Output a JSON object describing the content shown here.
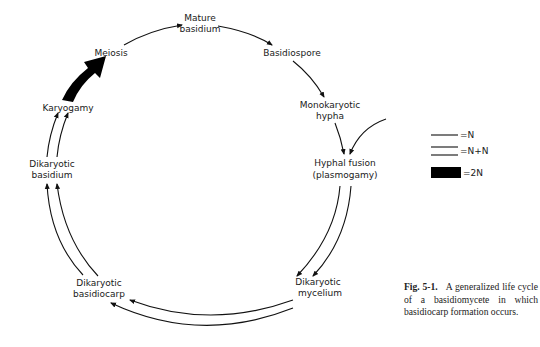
{
  "figure": {
    "type": "life-cycle diagram",
    "nodes": [
      {
        "id": "mature_basidium",
        "lines": [
          "Mature",
          "basidium"
        ]
      },
      {
        "id": "basidiospore",
        "lines": [
          "Basidiospore"
        ]
      },
      {
        "id": "monokaryotic_hypha",
        "lines": [
          "Monokaryotic",
          "hypha"
        ]
      },
      {
        "id": "hyphal_fusion",
        "lines": [
          "Hyphal fusion",
          "(plasmogamy)"
        ]
      },
      {
        "id": "dikaryotic_mycelium",
        "lines": [
          "Dikaryotic",
          "mycelium"
        ]
      },
      {
        "id": "dikaryotic_basidiocarp",
        "lines": [
          "Dikaryotic",
          "basidiocarp"
        ]
      },
      {
        "id": "dikaryotic_basidium",
        "lines": [
          "Dikaryotic",
          "basidium"
        ]
      },
      {
        "id": "karyogamy",
        "lines": [
          "Karyogamy"
        ]
      },
      {
        "id": "meiosis",
        "lines": [
          "Meiosis"
        ]
      }
    ],
    "edges": [
      {
        "from": "meiosis",
        "to": "mature_basidium",
        "ploidy": "N"
      },
      {
        "from": "mature_basidium",
        "to": "basidiospore",
        "ploidy": "N"
      },
      {
        "from": "basidiospore",
        "to": "monokaryotic_hypha",
        "ploidy": "N"
      },
      {
        "from": "monokaryotic_hypha",
        "to": "hyphal_fusion",
        "ploidy": "N"
      },
      {
        "from": "external",
        "to": "hyphal_fusion",
        "ploidy": "N"
      },
      {
        "from": "hyphal_fusion",
        "to": "dikaryotic_mycelium",
        "ploidy": "N+N"
      },
      {
        "from": "dikaryotic_mycelium",
        "to": "dikaryotic_basidiocarp",
        "ploidy": "N+N"
      },
      {
        "from": "dikaryotic_basidiocarp",
        "to": "dikaryotic_basidium",
        "ploidy": "N+N"
      },
      {
        "from": "dikaryotic_basidium",
        "to": "karyogamy",
        "ploidy": "N+N"
      },
      {
        "from": "karyogamy",
        "to": "meiosis",
        "ploidy": "2N"
      }
    ]
  },
  "labels": {
    "mature_1": "Mature",
    "mature_2": "basidium",
    "basidiospore": "Basidiospore",
    "mono_1": "Monokaryotic",
    "mono_2": "hypha",
    "fusion_1": "Hyphal fusion",
    "fusion_2": "(plasmogamy)",
    "dmyc_1": "Dikaryotic",
    "dmyc_2": "mycelium",
    "dbc_1": "Dikaryotic",
    "dbc_2": "basidiocarp",
    "dbas_1": "Dikaryotic",
    "dbas_2": "basidium",
    "karyogamy": "Karyogamy",
    "meiosis": "Meiosis"
  },
  "legend": {
    "single": "=N",
    "double": "=N+N",
    "solid": "=2N"
  },
  "caption": {
    "fig_number": "Fig. 5-1.",
    "text": "A generalized life cycle of a basidiomycete in which basidiocarp formation occurs."
  }
}
